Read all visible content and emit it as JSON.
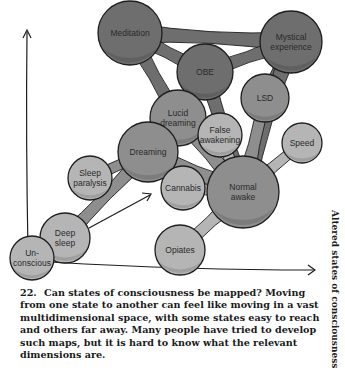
{
  "figure": {
    "number": "22.",
    "caption": "Can states of consciousness be mapped? Moving from one state to another can feel like moving in a vast multidimensional space, with some states easy to reach and others far away. Many people have tried to develop such maps, but it is hard to know what the relevant dimensions are.",
    "side_title": "Altered states of consciousness"
  },
  "colors": {
    "dark": "#6e6e6e",
    "medium": "#8e8e8e",
    "light": "#b5b5b5",
    "outline": "#1e1e1e",
    "background": "#ffffff"
  },
  "nodes": [
    {
      "id": "meditation",
      "label": [
        "Meditation"
      ],
      "shade": "dark"
    },
    {
      "id": "obe",
      "label": [
        "OBE"
      ],
      "shade": "dark"
    },
    {
      "id": "mystical",
      "label": [
        "Mystical",
        "experience"
      ],
      "shade": "dark"
    },
    {
      "id": "lucid",
      "label": [
        "Lucid",
        "dreaming"
      ],
      "shade": "medium"
    },
    {
      "id": "lsd",
      "label": [
        "LSD"
      ],
      "shade": "medium"
    },
    {
      "id": "dreaming",
      "label": [
        "Dreaming"
      ],
      "shade": "medium"
    },
    {
      "id": "false",
      "label": [
        "False",
        "awakening"
      ],
      "shade": "light"
    },
    {
      "id": "speed",
      "label": [
        "Speed"
      ],
      "shade": "light"
    },
    {
      "id": "sleepparalysis",
      "label": [
        "Sleep",
        "paralysis"
      ],
      "shade": "light"
    },
    {
      "id": "cannabis",
      "label": [
        "Cannabis"
      ],
      "shade": "light"
    },
    {
      "id": "normal",
      "label": [
        "Normal",
        "awake"
      ],
      "shade": "medium"
    },
    {
      "id": "deepsleep",
      "label": [
        "Deep",
        "sleep"
      ],
      "shade": "light"
    },
    {
      "id": "opiates",
      "label": [
        "Opiates"
      ],
      "shade": "light"
    },
    {
      "id": "unconscious",
      "label": [
        "Un-",
        "conscious"
      ],
      "shade": "light"
    }
  ],
  "edges": [
    [
      "meditation",
      "obe"
    ],
    [
      "meditation",
      "lucid"
    ],
    [
      "meditation",
      "mystical"
    ],
    [
      "obe",
      "mystical"
    ],
    [
      "obe",
      "lucid"
    ],
    [
      "obe",
      "normal"
    ],
    [
      "mystical",
      "lsd"
    ],
    [
      "mystical",
      "normal"
    ],
    [
      "lucid",
      "dreaming"
    ],
    [
      "lucid",
      "false"
    ],
    [
      "lucid",
      "normal"
    ],
    [
      "lsd",
      "normal"
    ],
    [
      "dreaming",
      "sleepparalysis"
    ],
    [
      "dreaming",
      "deepsleep"
    ],
    [
      "dreaming",
      "normal"
    ],
    [
      "false",
      "normal"
    ],
    [
      "speed",
      "normal"
    ],
    [
      "cannabis",
      "normal"
    ],
    [
      "opiates",
      "normal"
    ],
    [
      "deepsleep",
      "unconscious"
    ]
  ],
  "axes": {
    "vertical_arrow": true,
    "horizontal_arrow": true,
    "diagonal_arrow": true
  }
}
